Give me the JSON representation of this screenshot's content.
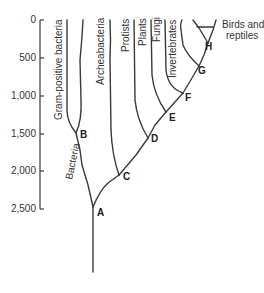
{
  "axis": {
    "ticks": [
      {
        "label": "0",
        "y": 20
      },
      {
        "label": "500",
        "y": 58
      },
      {
        "label": "1,000",
        "y": 96
      },
      {
        "label": "1,500",
        "y": 134
      },
      {
        "label": "2,000",
        "y": 171
      },
      {
        "label": "2,500",
        "y": 209
      }
    ]
  },
  "nodes": {
    "A": "A",
    "B": "B",
    "C": "C",
    "D": "D",
    "E": "E",
    "F": "F",
    "G": "G",
    "H": "H"
  },
  "leaves": {
    "gram_positive": "Gram-positive bacteria",
    "bacteria": "Bacteria",
    "archeabacteria": "Archeabacteria",
    "protists": "Protists",
    "plants": "Plants",
    "fungi": "Fungi",
    "invertebrates": "Invertebrates",
    "birds_line1": "Birds and",
    "birds_line2": "reptiles"
  }
}
